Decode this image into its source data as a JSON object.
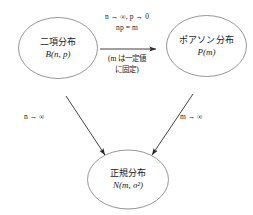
{
  "figure": {
    "background_color": "#ffffff",
    "stroke_color": "#8a8a8a",
    "arrow_color": "#2b2b2b",
    "text_color": "#1a1a1a"
  },
  "nodes": {
    "binomial": {
      "title": "二項分布",
      "formula_name": "B",
      "formula_args": "(n, p)",
      "formula": "B(n, p)"
    },
    "poisson": {
      "title": "ポアソン分布",
      "formula_name": "P",
      "formula_args": "(m)",
      "formula": "P(m)"
    },
    "normal": {
      "title": "正規分布",
      "formula_name": "N",
      "formula_args": "(m, σ²)",
      "formula": "N(m, σ²)"
    }
  },
  "edges": {
    "binomial_to_poisson": {
      "label_above_line1": "n → ∞,  p → 0",
      "label_above_line2": "np = m",
      "label_below_line1": "(m は一定値",
      "label_below_line2": "に固定)",
      "arrow_name": "horizontal-arrow"
    },
    "binomial_to_normal": {
      "label": "n → ∞",
      "arrow_name": "diagonal-arrow-left"
    },
    "poisson_to_normal": {
      "label": "m → ∞",
      "arrow_name": "diagonal-arrow-right"
    }
  },
  "symbols": {
    "arrow": "→",
    "infinity": "∞"
  }
}
